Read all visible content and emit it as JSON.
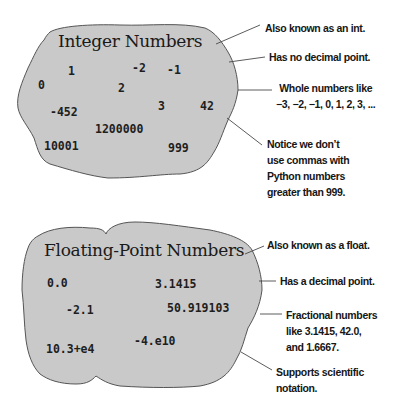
{
  "integer_panel": {
    "title": "Integer Numbers",
    "values": [
      "1",
      "-2",
      "-1",
      "0",
      "2",
      "-452",
      "3",
      "42",
      "1200000",
      "10001",
      "999"
    ],
    "callouts": [
      {
        "lines": [
          "Also known as an int."
        ]
      },
      {
        "lines": [
          "Has no decimal point."
        ]
      },
      {
        "lines": [
          "Whole numbers like",
          "−3, −2, −1, 0, 1, 2, 3, ..."
        ]
      },
      {
        "lines": [
          "Notice we don’t",
          "use commas with",
          "Python numbers",
          "greater than 999."
        ]
      }
    ]
  },
  "float_panel": {
    "title": "Floating-Point Numbers",
    "values": [
      "0.0",
      "3.1415",
      "-2.1",
      "50.919103",
      "-4.e10",
      "10.3+e4"
    ],
    "callouts": [
      {
        "lines": [
          "Also known as a float."
        ]
      },
      {
        "lines": [
          "Has a decimal point."
        ]
      },
      {
        "lines": [
          "Fractional numbers",
          "like 3.1415, 42.0,",
          "and 1.6667."
        ]
      },
      {
        "lines": [
          "Supports scientific",
          "notation."
        ]
      }
    ]
  },
  "colors": {
    "blob_fill": "#c8c8c8",
    "blob_stroke": "#5a5a5a",
    "line": "#4a4a4a",
    "text": "#1a1a1a"
  }
}
